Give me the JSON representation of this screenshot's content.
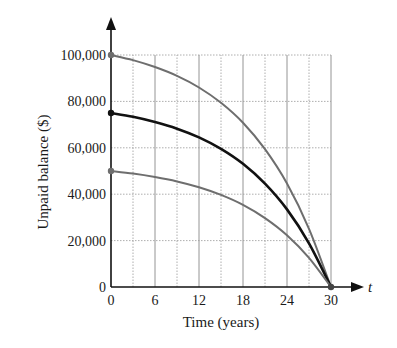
{
  "chart_data": {
    "type": "line",
    "title": "",
    "xlabel": "Time (years)",
    "ylabel": "Unpaid balance ($)",
    "x_axis_symbol": "t",
    "xlim": [
      0,
      30
    ],
    "ylim": [
      0,
      100000
    ],
    "x_ticks": [
      0,
      6,
      12,
      18,
      24,
      30
    ],
    "x_tick_labels": [
      "0",
      "6",
      "12",
      "18",
      "24",
      "30"
    ],
    "y_ticks": [
      0,
      20000,
      40000,
      60000,
      80000,
      100000
    ],
    "y_tick_labels": [
      "0",
      "20,000",
      "40,000",
      "60,000",
      "80,000",
      "100,000"
    ],
    "grid": true,
    "grid_x_step": 3,
    "legend": null,
    "x": [
      0,
      3,
      6,
      9,
      12,
      15,
      18,
      21,
      24,
      27,
      30
    ],
    "series": [
      {
        "name": "Initial balance $100,000",
        "color": "#6e6e6e",
        "width": 2,
        "values": [
          100000,
          97800,
          94800,
          91000,
          86000,
          79400,
          70800,
          59400,
          44600,
          25100,
          0
        ]
      },
      {
        "name": "Initial balance $75,000",
        "color": "#111111",
        "width": 2.6,
        "values": [
          75000,
          73350,
          71100,
          68250,
          64500,
          59550,
          53100,
          44550,
          33450,
          18825,
          0
        ]
      },
      {
        "name": "Initial balance $50,000",
        "color": "#6e6e6e",
        "width": 2,
        "values": [
          50000,
          48900,
          47400,
          45500,
          43000,
          39700,
          35400,
          29700,
          22300,
          12550,
          0
        ]
      }
    ]
  }
}
